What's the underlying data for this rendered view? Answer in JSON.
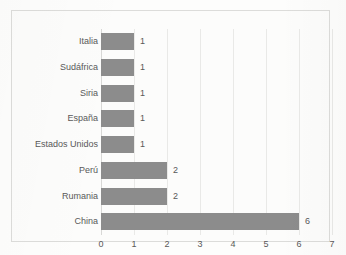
{
  "chart_data": {
    "type": "bar",
    "orientation": "horizontal",
    "title": "",
    "subtitle": "",
    "xlabel": "",
    "ylabel": "",
    "categories": [
      "Italia",
      "Sudáfrica",
      "Siria",
      "España",
      "Estados Unidos",
      "Perú",
      "Rumania",
      "China"
    ],
    "values": [
      1,
      1,
      1,
      1,
      1,
      2,
      2,
      6
    ],
    "data_labels": [
      "1",
      "1",
      "1",
      "1",
      "1",
      "2",
      "2",
      "6"
    ],
    "xlim": [
      0,
      7
    ],
    "xticks": [
      0,
      1,
      2,
      3,
      4,
      5,
      6,
      7
    ],
    "xtick_labels": [
      "0",
      "1",
      "2",
      "3",
      "4",
      "5",
      "6",
      "7"
    ],
    "grid": "vertical",
    "legend": "none",
    "bar_color": "#8c8c8c",
    "text_color": "#595959",
    "gridline_color": "#e9e9e7",
    "background_color": "#fcfcfb",
    "frame_color": "#dcdcda"
  }
}
